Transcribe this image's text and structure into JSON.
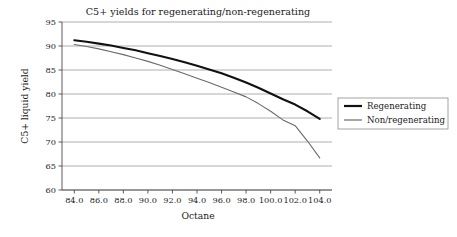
{
  "chart_data": {
    "type": "line",
    "title": "C5+ yields for regenerating/non-regenerating",
    "xlabel": "Octane",
    "ylabel": "C5+ liquid yield",
    "xlim": [
      83.0,
      105.0
    ],
    "ylim": [
      60,
      95
    ],
    "grid": true,
    "grid_axis": "y",
    "legend_position": "right",
    "xticks": [
      "84.0",
      "86.0",
      "88.0",
      "90.0",
      "92.0",
      "94.0",
      "96.0",
      "98.0",
      "100.0",
      "102.0",
      "104.0"
    ],
    "xtick_values": [
      84,
      86,
      88,
      90,
      92,
      94,
      96,
      98,
      100,
      102,
      104
    ],
    "yticks": [
      "95",
      "90",
      "85",
      "80",
      "75",
      "70",
      "65",
      "60"
    ],
    "ytick_values": [
      95,
      90,
      85,
      80,
      75,
      70,
      65,
      60
    ],
    "series": [
      {
        "name": "Regenerating",
        "color": "#111111",
        "line_width": 2.1,
        "x": [
          84,
          85,
          86,
          87,
          88,
          89,
          90,
          91,
          92,
          93,
          94,
          95,
          96,
          97,
          98,
          99,
          100,
          101,
          102,
          103,
          104
        ],
        "values": [
          91.2,
          90.9,
          90.5,
          90.1,
          89.6,
          89.1,
          88.5,
          87.9,
          87.3,
          86.6,
          85.9,
          85.1,
          84.3,
          83.4,
          82.4,
          81.3,
          80.1,
          78.9,
          77.8,
          76.4,
          74.8
        ]
      },
      {
        "name": "Non/regenerating",
        "color": "#6a6a6a",
        "line_width": 1.1,
        "x": [
          84,
          85,
          86,
          87,
          88,
          89,
          90,
          91,
          92,
          93,
          94,
          95,
          96,
          97,
          98,
          99,
          100,
          101,
          102,
          103,
          104
        ],
        "values": [
          90.3,
          89.9,
          89.4,
          88.8,
          88.2,
          87.5,
          86.8,
          86.0,
          85.1,
          84.2,
          83.3,
          82.4,
          81.4,
          80.4,
          79.4,
          78.0,
          76.4,
          74.6,
          73.4,
          70.2,
          66.7
        ]
      }
    ]
  },
  "legend": {
    "items": [
      {
        "label": "Regenerating"
      },
      {
        "label": "Non/regenerating"
      }
    ]
  },
  "colors": {
    "regenerating": "#111111",
    "non_regenerating": "#6a6a6a",
    "gridline": "#9a9a9a",
    "axis": "#4a4a4a",
    "legend_border": "#8c8c8c",
    "background": "#ffffff"
  }
}
